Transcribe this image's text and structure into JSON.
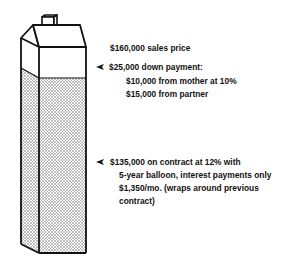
{
  "diagram": {
    "type": "house-financing-illustration",
    "colors": {
      "ink": "#111111",
      "stipple": "#bbbbbb",
      "background": "#ffffff"
    },
    "labels": {
      "sales_price": "$160,000 sales price",
      "down_payment": {
        "title": "$25,000 down payment:",
        "lines": [
          "$10,000 from mother at 10%",
          "$15,000 from partner"
        ]
      },
      "contract": {
        "lines": [
          "$135,000 on contract at 12% with",
          "5-year balloon, interest payments only",
          "$1,350/mo. (wraps around previous",
          "contract)"
        ]
      }
    },
    "icons": {
      "pointer": "arrowhead-left-icon"
    }
  }
}
